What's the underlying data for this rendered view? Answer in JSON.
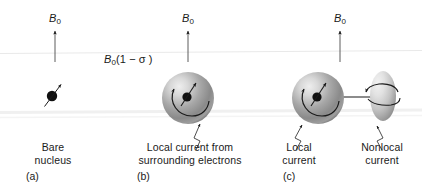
{
  "figure": {
    "background_color": "#ffffff",
    "ink_color": "#1a1a1a",
    "sphere_color_light": "#e3e3e3",
    "sphere_color_mid": "#9a9a9a",
    "sphere_color_dark": "#6e6e6e",
    "scanline_color": "#e8e8e8"
  },
  "field_labels": {
    "b0_symbol": "B",
    "b0_subscript": "0",
    "panel_a": "B0",
    "panel_b": "B0",
    "panel_c": "B0"
  },
  "shielded_field": {
    "symbol": "B",
    "subscript": "0",
    "expression": "(1 − σ )",
    "full_text": "B0(1 − σ )"
  },
  "panels": [
    {
      "id": "a",
      "panel_label": "(a)",
      "caption_lines": [
        "Bare",
        "nucleus"
      ],
      "caption_text": "Bare nucleus",
      "has_sphere": false,
      "has_ellipse": false,
      "callouts": []
    },
    {
      "id": "b",
      "panel_label": "(b)",
      "caption_lines": [
        "Local current from",
        "surrounding electrons"
      ],
      "caption_text": "Local current from surrounding electrons",
      "has_sphere": true,
      "has_ellipse": false,
      "callouts": [
        {
          "name": "local-current",
          "text": "Local current from surrounding electrons"
        }
      ]
    },
    {
      "id": "c",
      "panel_label": "(c)",
      "caption_lines": [],
      "caption_text": "",
      "has_sphere": true,
      "has_ellipse": true,
      "callouts": [
        {
          "name": "local-current",
          "lines": [
            "Local",
            "current"
          ],
          "text": "Local current"
        },
        {
          "name": "nonlocal-current",
          "lines": [
            "Nonlocal",
            "current"
          ],
          "text": "Nonlocal current"
        }
      ]
    }
  ],
  "captions": {
    "a_line1": "Bare",
    "a_line2": "nucleus",
    "b_line1": "Local current from",
    "b_line2": "surrounding electrons",
    "c_local_line1": "Local",
    "c_local_line2": "current",
    "c_nonlocal_line1": "Nonlocal",
    "c_nonlocal_line2": "current"
  },
  "panel_ids": {
    "a": "(a)",
    "b": "(b)",
    "c": "(c)"
  }
}
